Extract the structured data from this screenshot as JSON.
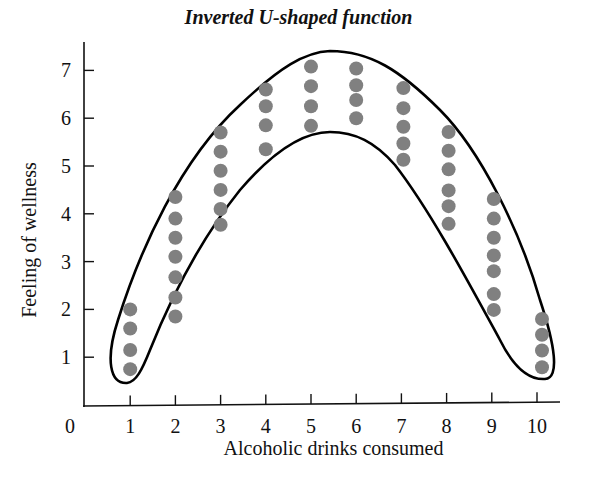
{
  "chart_data": {
    "type": "scatter",
    "title": "Inverted U-shaped function",
    "xlabel": "Alcoholic drinks consumed",
    "ylabel": "Feeling of wellness",
    "origin_label": "0",
    "x_ticks": [
      1,
      2,
      3,
      4,
      5,
      6,
      7,
      8,
      9,
      10
    ],
    "y_ticks": [
      1,
      2,
      3,
      4,
      5,
      6,
      7
    ],
    "xlim": [
      0,
      10.6
    ],
    "ylim": [
      0,
      7.6
    ],
    "grid": false,
    "legend": null,
    "annotations": [
      "Closed inverted-U band enclosing all points"
    ],
    "series": [
      {
        "name": "observations",
        "color": "#808080",
        "points": [
          {
            "x": 1,
            "y": [
              2.0,
              1.6,
              1.15,
              0.75
            ]
          },
          {
            "x": 2,
            "y": [
              4.35,
              3.9,
              3.5,
              3.1,
              2.67,
              2.25,
              1.85
            ]
          },
          {
            "x": 3,
            "y": [
              5.7,
              5.3,
              4.9,
              4.5,
              4.1,
              3.77
            ]
          },
          {
            "x": 4,
            "y": [
              6.6,
              6.25,
              5.85,
              5.35
            ]
          },
          {
            "x": 5,
            "y": [
              7.08,
              6.67,
              6.25,
              5.84
            ]
          },
          {
            "x": 6,
            "y": [
              7.04,
              6.69,
              6.38,
              6.0
            ]
          },
          {
            "x": 7,
            "y": [
              6.63,
              6.21,
              5.82,
              5.47,
              5.13
            ]
          },
          {
            "x": 8,
            "y": [
              5.71,
              5.32,
              4.93,
              4.49,
              4.16,
              3.79
            ]
          },
          {
            "x": 9,
            "y": [
              4.31,
              3.9,
              3.5,
              3.13,
              2.8,
              2.32,
              1.99
            ]
          },
          {
            "x": 10,
            "y": [
              1.8,
              1.47,
              1.14,
              0.79
            ]
          }
        ]
      }
    ],
    "colors": {
      "axis": "#111111",
      "dot": "#808080",
      "envelope": "#000000"
    }
  }
}
